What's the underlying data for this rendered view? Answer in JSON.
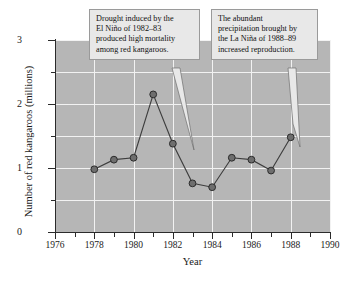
{
  "chart_data": {
    "type": "line",
    "title": "",
    "xlabel": "Year",
    "ylabel": "Number of red kangaroos (millions)",
    "xlim": [
      1976,
      1990
    ],
    "ylim": [
      0,
      3
    ],
    "grid": true,
    "legend": "none",
    "x_ticks": [
      1976,
      1978,
      1980,
      1982,
      1984,
      1986,
      1988,
      1990
    ],
    "x_tick_labels": [
      "1976",
      "1978",
      "1980",
      "1982",
      "1984",
      "1986",
      "1988",
      "1990"
    ],
    "x_minor_ticks": [
      1977,
      1979,
      1981,
      1983,
      1985,
      1987,
      1989
    ],
    "y_ticks": [
      0,
      1,
      2,
      3
    ],
    "y_tick_labels": [
      "0",
      "1",
      "2",
      "3"
    ],
    "y_minor_ticks": [
      0.5,
      1.5,
      2.5
    ],
    "x": [
      1978,
      1979,
      1980,
      1981,
      1982,
      1983,
      1984,
      1985,
      1986,
      1987,
      1988
    ],
    "values": [
      0.98,
      1.13,
      1.16,
      2.15,
      1.38,
      0.76,
      0.7,
      1.16,
      1.13,
      0.96,
      1.48
    ],
    "series": [
      {
        "name": "Red kangaroo population",
        "values": [
          0.98,
          1.13,
          1.16,
          2.15,
          1.38,
          0.76,
          0.7,
          1.16,
          1.13,
          0.96,
          1.48
        ]
      }
    ],
    "marker": "circle",
    "annotations": [
      {
        "id": "drought",
        "text": "Drought induced by the El Niño of 1982–83 produced high mortality among red kangaroos.",
        "lines": [
          "Drought induced by the",
          "El Niño of 1982–83",
          "produced high mortality",
          "among red kangaroos."
        ],
        "points_to_year": 1983
      },
      {
        "id": "precipitation",
        "text": "The abundant precipitation brought by the La Niña of 1988–89 increased reproduction.",
        "lines": [
          "The abundant",
          "precipitation brought by",
          "the La Niña of 1988–89",
          "increased reproduction."
        ],
        "points_to_year": 1988
      }
    ],
    "colors": {
      "plot_background": "#b6b6b6",
      "gridline": "#f2f2f2",
      "line": "#3d3d3d",
      "marker_fill": "#6e6e6e",
      "marker_edge": "#2b2b2b",
      "axis": "#2b2b2b",
      "callout_background": "#e8e8e8",
      "callout_border": "#9a9a9a",
      "page_background": "#ffffff"
    }
  }
}
